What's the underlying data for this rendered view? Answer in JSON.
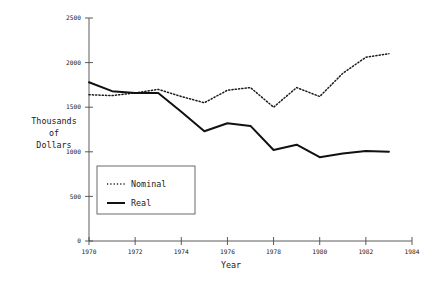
{
  "chart_data": {
    "type": "line",
    "title": "",
    "xlabel": "Year",
    "ylabel": "Thousands of Dollars",
    "ylabel_lines": [
      "Thousands",
      "of",
      "Dollars"
    ],
    "x": [
      1970,
      1971,
      1972,
      1973,
      1974,
      1975,
      1976,
      1977,
      1978,
      1979,
      1980,
      1981,
      1982,
      1983
    ],
    "xlim": [
      1970,
      1984
    ],
    "ylim": [
      0,
      2500
    ],
    "xticks": [
      1970,
      1972,
      1974,
      1976,
      1978,
      1980,
      1982,
      1984
    ],
    "xtick_labels": [
      "1970",
      "1972",
      "1974",
      "1976",
      "1978",
      "1980",
      "1982",
      "1984"
    ],
    "yticks": [
      0,
      500,
      1000,
      1500,
      2000,
      2500
    ],
    "ytick_labels": [
      "0",
      "500",
      "1000",
      "1500",
      "2000",
      "2500"
    ],
    "grid": false,
    "legend_position": "lower left",
    "series": [
      {
        "name": "Nominal",
        "style": "dotted",
        "color": "#1a1a1a",
        "values": [
          1640,
          1630,
          1660,
          1700,
          1620,
          1550,
          1690,
          1720,
          1500,
          1720,
          1620,
          1880,
          2060,
          2100
        ]
      },
      {
        "name": "Real",
        "style": "solid",
        "color": "#111111",
        "values": [
          1780,
          1680,
          1660,
          1660,
          1450,
          1230,
          1320,
          1290,
          1020,
          1080,
          940,
          980,
          1010,
          1000
        ]
      }
    ]
  },
  "legend": {
    "items": [
      {
        "label": "Nominal",
        "style": "dotted"
      },
      {
        "label": "Real",
        "style": "solid"
      }
    ]
  }
}
